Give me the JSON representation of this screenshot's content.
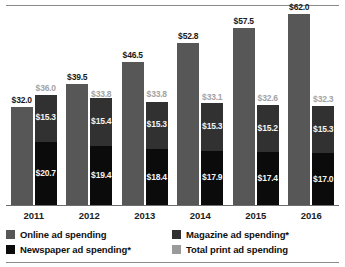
{
  "chart_data": {
    "type": "bar",
    "title": "",
    "subtitle": "",
    "xlabel": "",
    "ylabel": "",
    "categories": [
      "2011",
      "2012",
      "2013",
      "2014",
      "2015",
      "2016"
    ],
    "ylim": [
      0,
      62.0
    ],
    "grid": false,
    "legend_position": "bottom",
    "stacked_groups": true,
    "series": [
      {
        "name": "Online ad spending",
        "color": "#575757",
        "stack": "online",
        "values": [
          32.0,
          39.5,
          46.5,
          52.8,
          57.5,
          62.0
        ],
        "labels": [
          "$32.0",
          "$39.5",
          "$46.5",
          "$52.8",
          "$57.5",
          "$62.0"
        ]
      },
      {
        "name": "Magazine ad spending*",
        "color": "#313131",
        "stack": "print",
        "values": [
          15.3,
          15.4,
          15.3,
          15.3,
          15.2,
          15.3
        ],
        "labels": [
          "$15.3",
          "$15.4",
          "$15.3",
          "$15.3",
          "$15.2",
          "$15.3"
        ]
      },
      {
        "name": "Newspaper ad spending*",
        "color": "#0b0b0b",
        "stack": "print",
        "values": [
          20.7,
          19.4,
          18.4,
          17.9,
          17.4,
          17.0
        ],
        "labels": [
          "$20.7",
          "$19.4",
          "$18.4",
          "$17.9",
          "$17.4",
          "$17.0"
        ]
      },
      {
        "name": "Total print ad spending",
        "color": "#9a9a9a",
        "stack": "print-total",
        "values": [
          36.0,
          33.8,
          33.8,
          33.1,
          32.6,
          32.3
        ],
        "labels": [
          "$36.0",
          "$33.8",
          "$33.8",
          "$33.1",
          "$32.6",
          "$32.3"
        ]
      }
    ]
  },
  "axis": {
    "ticks": [
      "2011",
      "2012",
      "2013",
      "2014",
      "2015",
      "2016"
    ]
  },
  "legend": {
    "items": [
      {
        "label": "Online ad spending",
        "color": "#575757"
      },
      {
        "label": "Magazine ad spending*",
        "color": "#313131"
      },
      {
        "label": "Newspaper ad spending*",
        "color": "#0b0b0b"
      },
      {
        "label": "Total print ad spending",
        "color": "#9a9a9a"
      }
    ]
  }
}
